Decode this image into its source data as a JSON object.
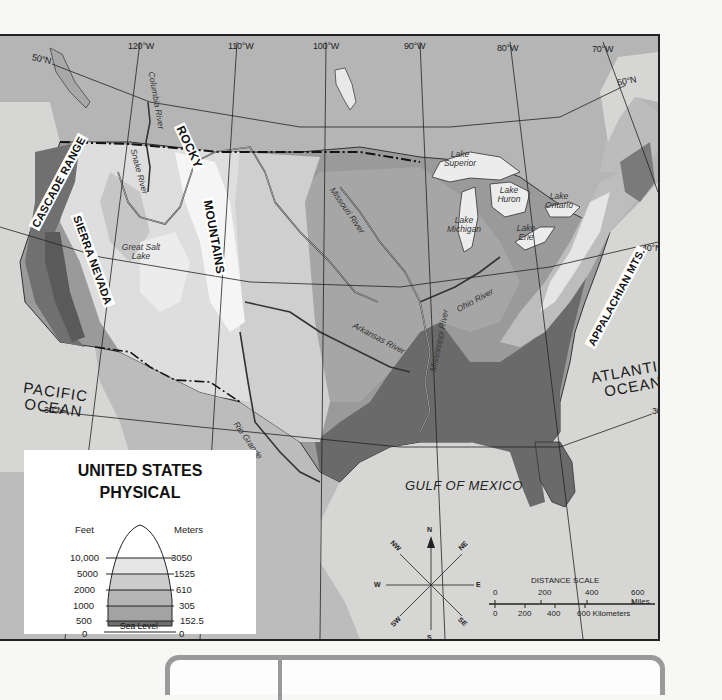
{
  "map": {
    "title_line1": "UNITED STATES",
    "title_line2": "PHYSICAL",
    "colors": {
      "ocean": "#d8d8d6",
      "land_outside": "#b9b9b9",
      "sea_level_0_500": "#6a6a6a",
      "elev_500_1000": "#9a9a9a",
      "elev_1000_2000": "#b3b3b3",
      "elev_2000_5000": "#c9c9c9",
      "elev_5000_10000": "#e2e2e2",
      "elev_10000_plus": "#f6f6f6",
      "lakes": "#ececec",
      "frame": "#222222"
    },
    "longitude_labels": [
      "120°W",
      "110°W",
      "100°W",
      "90°W",
      "80°W",
      "70°W"
    ],
    "latitude_labels": {
      "n50_west": "50°N",
      "n50_east": "50°N",
      "n40": "40°N",
      "n30_west": "30°N",
      "n30_east": "30°N"
    },
    "mountain_labels": {
      "cascade": "CASCADE RANGE",
      "sierra": "SIERRA NEVADA",
      "rocky_1": "ROCKY",
      "rocky_2": "MOUNTAINS",
      "appalachian": "APPALACHIAN MTS."
    },
    "water_labels": {
      "columbia": "Columbia River",
      "snake": "Snake River",
      "great_salt_lake": "Great Salt Lake",
      "missouri": "Missouri River",
      "arkansas": "Arkansas River",
      "mississippi": "Mississippi River",
      "ohio": "Ohio River",
      "rio_grande": "Rio Grande",
      "lake_superior": "Lake Superior",
      "lake_michigan": "Lake Michigan",
      "lake_huron": "Lake Huron",
      "lake_ontario": "Lake Ontario",
      "lake_erie": "Lake Erie"
    },
    "oceans": {
      "pacific_1": "PACIFIC",
      "pacific_2": "OCEAN",
      "atlantic_1": "ATLANTIC",
      "atlantic_2": "OCEAN",
      "gulf": "GULF OF MEXICO"
    }
  },
  "legend": {
    "feet_header": "Feet",
    "meters_header": "Meters",
    "rows": [
      {
        "feet": "10,000",
        "meters": "3050"
      },
      {
        "feet": "5000",
        "meters": "1525"
      },
      {
        "feet": "2000",
        "meters": "610"
      },
      {
        "feet": "1000",
        "meters": "305"
      },
      {
        "feet": "500",
        "meters": "152.5"
      },
      {
        "feet": "0",
        "meters": "0"
      }
    ],
    "sea_level_label": "Sea Level"
  },
  "compass": {
    "n": "N",
    "ne": "NE",
    "e": "E",
    "se": "SE",
    "s": "S",
    "sw": "SW",
    "w": "W",
    "nw": "NW"
  },
  "scale": {
    "title": "DISTANCE SCALE",
    "miles_ticks": [
      "0",
      "200",
      "400",
      "600 Miles"
    ],
    "km_ticks": [
      "0",
      "200",
      "400",
      "600 Kilometers"
    ]
  }
}
